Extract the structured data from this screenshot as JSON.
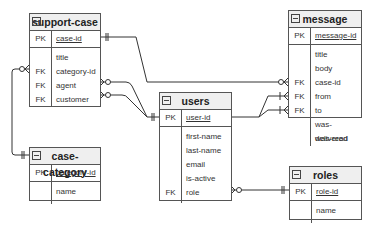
{
  "diagram": {
    "type": "entity-relationship",
    "entities": {
      "support_case": {
        "title": "support-case",
        "pk": {
          "key": "PK",
          "name": "case-id"
        },
        "attributes": [
          {
            "key": "",
            "name": "title"
          },
          {
            "key": "FK",
            "name": "category-id"
          },
          {
            "key": "FK",
            "name": "agent"
          },
          {
            "key": "FK",
            "name": "customer"
          }
        ]
      },
      "message": {
        "title": "message",
        "pk": {
          "key": "PK",
          "name": "message-id"
        },
        "attributes": [
          {
            "key": "",
            "name": "title"
          },
          {
            "key": "",
            "name": "body"
          },
          {
            "key": "FK",
            "name": "case-id"
          },
          {
            "key": "FK",
            "name": "from"
          },
          {
            "key": "FK",
            "name": "to"
          },
          {
            "key": "",
            "name": "was-delivered"
          },
          {
            "key": "",
            "name": "was-read"
          }
        ]
      },
      "users": {
        "title": "users",
        "pk": {
          "key": "PK",
          "name": "user-id"
        },
        "attributes": [
          {
            "key": "",
            "name": "first-name"
          },
          {
            "key": "",
            "name": "last-name"
          },
          {
            "key": "",
            "name": "email"
          },
          {
            "key": "",
            "name": "is-active"
          },
          {
            "key": "FK",
            "name": "role"
          }
        ]
      },
      "case_category": {
        "title": "case-category",
        "pk": {
          "key": "PK",
          "name": "category-id"
        },
        "attributes": [
          {
            "key": "",
            "name": "name"
          }
        ]
      },
      "roles": {
        "title": "roles",
        "pk": {
          "key": "PK",
          "name": "role-id"
        },
        "attributes": [
          {
            "key": "",
            "name": "name"
          }
        ]
      }
    },
    "relationships": [
      {
        "from": "support-case.case-id",
        "to": "message.case-id",
        "from_card": "one-and-only-one",
        "to_card": "zero-or-many"
      },
      {
        "from": "case-category.category-id",
        "to": "support-case.category-id",
        "from_card": "one-and-only-one",
        "to_card": "zero-or-many"
      },
      {
        "from": "users.user-id",
        "to": "support-case.agent",
        "from_card": "one-and-only-one",
        "to_card": "zero-or-many"
      },
      {
        "from": "users.user-id",
        "to": "support-case.customer",
        "from_card": "one-and-only-one",
        "to_card": "zero-or-many"
      },
      {
        "from": "users.user-id",
        "to": "message.from",
        "from_card": "one",
        "to_card": "one-or-many"
      },
      {
        "from": "users.user-id",
        "to": "message.to",
        "from_card": "one",
        "to_card": "one-or-many"
      },
      {
        "from": "roles.role-id",
        "to": "users.role",
        "from_card": "one-and-only-one",
        "to_card": "zero-or-many"
      }
    ],
    "colors": {
      "line": "#333333",
      "header_bg": "#efefef",
      "border": "#555555"
    }
  }
}
